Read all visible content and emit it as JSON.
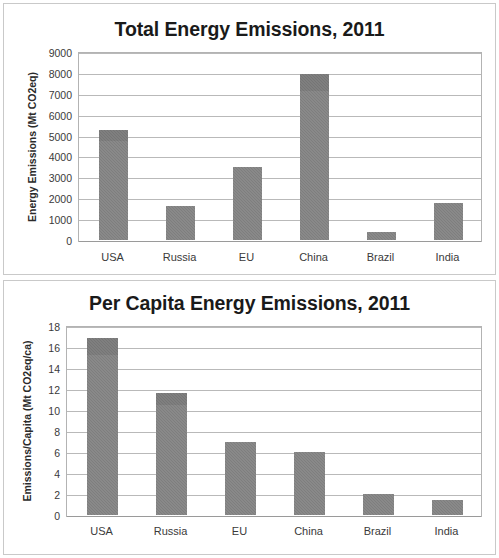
{
  "chart_data": [
    {
      "type": "bar",
      "title": "Total Energy Emissions, 2011",
      "xlabel": "",
      "ylabel": "Energy Emissions (Mt CO2eq)",
      "categories": [
        "USA",
        "Russia",
        "EU",
        "China",
        "Brazil",
        "India"
      ],
      "values": [
        5250,
        1650,
        3500,
        7950,
        400,
        1750
      ],
      "yticks": [
        0,
        1000,
        2000,
        3000,
        4000,
        5000,
        6000,
        7000,
        8000,
        9000
      ],
      "ytick_labels": [
        "0",
        "1000",
        "2000",
        "3000",
        "4000",
        "5000",
        "6000",
        "7000",
        "8000",
        "9000"
      ],
      "ylim": [
        0,
        9000
      ],
      "grid": true,
      "legend": false,
      "bar_color": "#7e7e7e"
    },
    {
      "type": "bar",
      "title": "Per Capita Energy Emissions, 2011",
      "xlabel": "",
      "ylabel": "Emissions/Capita (Mt CO2eq/ca)",
      "categories": [
        "USA",
        "Russia",
        "EU",
        "China",
        "Brazil",
        "India"
      ],
      "values": [
        16.9,
        11.6,
        7.0,
        6.0,
        2.0,
        1.4
      ],
      "yticks": [
        0,
        2,
        4,
        6,
        8,
        10,
        12,
        14,
        16,
        18
      ],
      "ytick_labels": [
        "0",
        "2",
        "4",
        "6",
        "8",
        "10",
        "12",
        "14",
        "16",
        "18"
      ],
      "ylim": [
        0,
        18
      ],
      "grid": true,
      "legend": false,
      "bar_color": "#7e7e7e"
    }
  ],
  "panels": [
    {
      "name": "total-energy-emissions",
      "title": "Total Energy Emissions, 2011",
      "ylabel": "Energy Emissions (Mt CO2eq)"
    },
    {
      "name": "per-capita-energy-emissions",
      "title": "Per Capita Energy Emissions, 2011",
      "ylabel": "Emissions/Capita (Mt CO2eq/ca)"
    }
  ]
}
